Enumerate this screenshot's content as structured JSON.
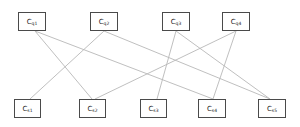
{
  "diagram": {
    "type": "bipartite-graph",
    "top_row": [
      {
        "id": "cq1",
        "base": "C",
        "sub": "q1",
        "x": 18,
        "y": 12,
        "w": 28
      },
      {
        "id": "cq2",
        "base": "C",
        "sub": "q2",
        "x": 90,
        "y": 12,
        "w": 28
      },
      {
        "id": "cq3",
        "base": "C",
        "sub": "q3",
        "x": 162,
        "y": 12,
        "w": 28
      },
      {
        "id": "cq4",
        "base": "C",
        "sub": "q4",
        "x": 222,
        "y": 12,
        "w": 28
      }
    ],
    "bottom_row": [
      {
        "id": "cs1",
        "base": "C",
        "sub": "s1",
        "x": 14,
        "y": 99,
        "w": 27
      },
      {
        "id": "cs2",
        "base": "C",
        "sub": "s2",
        "x": 79,
        "y": 99,
        "w": 27
      },
      {
        "id": "cs3",
        "base": "C",
        "sub": "s3",
        "x": 140,
        "y": 99,
        "w": 27
      },
      {
        "id": "cs4",
        "base": "C",
        "sub": "s4",
        "x": 198,
        "y": 99,
        "w": 28
      },
      {
        "id": "cs5",
        "base": "C",
        "sub": "s5",
        "x": 258,
        "y": 99,
        "w": 28
      }
    ],
    "edges": [
      {
        "from": "cq1",
        "to": "cs2",
        "x1": 35,
        "y1": 31,
        "x2": 92,
        "y2": 99
      },
      {
        "from": "cq1",
        "to": "cs4",
        "x1": 35,
        "y1": 31,
        "x2": 213,
        "y2": 99
      },
      {
        "from": "cq2",
        "to": "cs1",
        "x1": 104,
        "y1": 31,
        "x2": 30,
        "y2": 99
      },
      {
        "from": "cq2",
        "to": "cs5",
        "x1": 104,
        "y1": 31,
        "x2": 270,
        "y2": 99
      },
      {
        "from": "cq3",
        "to": "cs3",
        "x1": 176,
        "y1": 31,
        "x2": 157,
        "y2": 99
      },
      {
        "from": "cq3",
        "to": "cs5",
        "x1": 176,
        "y1": 31,
        "x2": 270,
        "y2": 99
      },
      {
        "from": "cq4",
        "to": "cs2",
        "x1": 236,
        "y1": 31,
        "x2": 95,
        "y2": 99
      },
      {
        "from": "cq4",
        "to": "cs4",
        "x1": 236,
        "y1": 31,
        "x2": 213,
        "y2": 99
      }
    ],
    "colors": {
      "edge": "#b8b8b8",
      "border": "#4a4a4a",
      "text": "#222222"
    }
  }
}
